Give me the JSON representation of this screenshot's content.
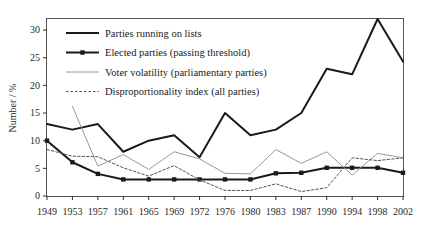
{
  "chart_data": {
    "type": "line",
    "title": "",
    "xlabel": "",
    "ylabel": "Number / %",
    "x": [
      1949,
      1953,
      1957,
      1961,
      1965,
      1969,
      1972,
      1976,
      1980,
      1983,
      1987,
      1990,
      1994,
      1998,
      2002
    ],
    "categories": [
      "1949",
      "1953",
      "1957",
      "1961",
      "1965",
      "1969",
      "1972",
      "1976",
      "1980",
      "1983",
      "1987",
      "1990",
      "1994",
      "1998",
      "2002"
    ],
    "ylim": [
      0,
      32
    ],
    "xlim": [
      1949,
      2002
    ],
    "yticks": [
      0,
      5,
      10,
      15,
      20,
      25,
      30
    ],
    "ytick_labels": [
      "0",
      "5",
      "10",
      "15",
      "20",
      "25",
      "30"
    ],
    "grid": false,
    "legend_position": "top-left",
    "series": [
      {
        "name": "Parties running on lists",
        "style": "solid-thick",
        "color": "#1a1a1a",
        "marker": "none",
        "values": [
          13,
          12,
          13,
          8,
          10,
          11,
          7,
          15,
          11,
          12,
          15,
          23,
          22,
          32,
          24.3
        ]
      },
      {
        "name": "Elected parties (passing threshold)",
        "style": "solid-thick-marker",
        "color": "#1a1a1a",
        "marker": "square",
        "values": [
          10,
          6.1,
          4,
          3,
          3,
          3,
          3,
          3,
          3,
          4.1,
          4.2,
          5.1,
          5.1,
          5.1,
          4.2
        ]
      },
      {
        "name": "Voter volatility (parliamentary parties)",
        "style": "solid-thin-grey",
        "color": "#9a9a9a",
        "marker": "none",
        "values": [
          null,
          16.2,
          5.4,
          7.5,
          4.8,
          8,
          6.7,
          4.1,
          4,
          8.4,
          5.9,
          8,
          3.8,
          7.7,
          6.9
        ]
      },
      {
        "name": "Disproportionality index (all parties)",
        "style": "dashed-thin",
        "color": "#555555",
        "marker": "none",
        "values": [
          8.4,
          7.2,
          7.1,
          5.1,
          3.6,
          5.5,
          2.9,
          1.0,
          1.0,
          2.2,
          0.8,
          1.5,
          6.9,
          6.4,
          6.9
        ]
      }
    ]
  },
  "legend": {
    "items": [
      {
        "label": "Parties running on lists"
      },
      {
        "label": "Elected parties (passing threshold)"
      },
      {
        "label": "Voter volatility (parliamentary parties)"
      },
      {
        "label": "Disproportionality index (all parties)"
      }
    ]
  },
  "axes": {
    "y_title": "Number / %"
  }
}
